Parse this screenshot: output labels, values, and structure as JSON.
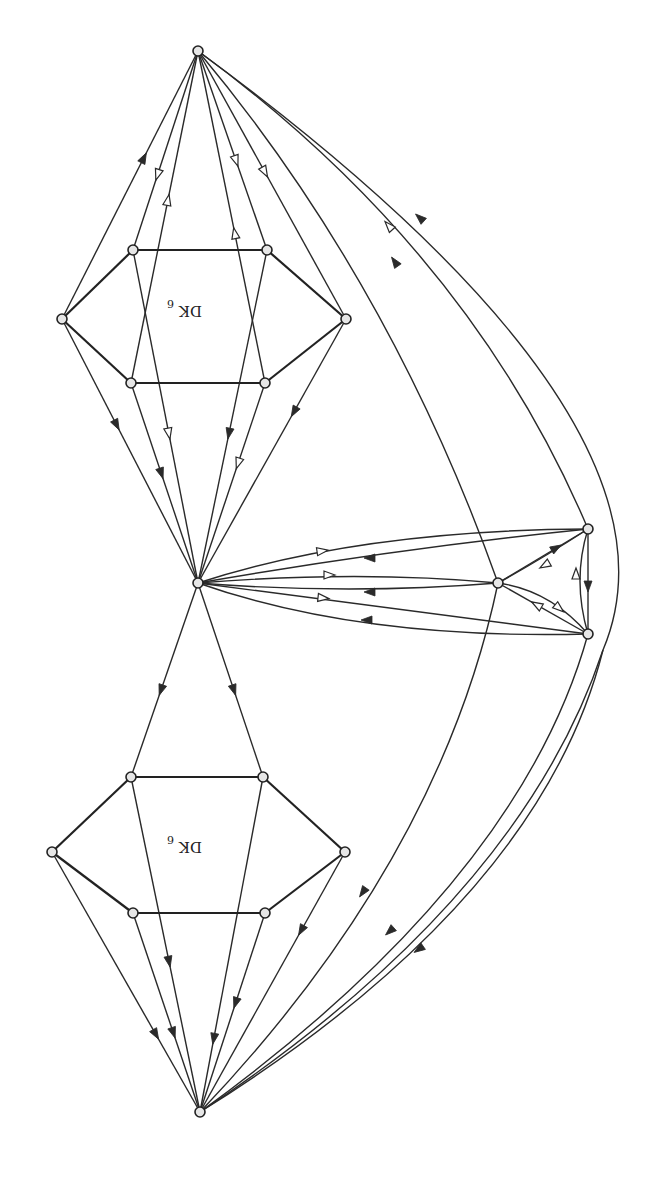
{
  "figure": {
    "orientation": "rotated 180 degrees",
    "labels": [
      {
        "id": "upper",
        "main": "DK",
        "sub": "6",
        "x": 186,
        "y": 312
      },
      {
        "id": "lower",
        "main": "DK",
        "sub": "6",
        "x": 186,
        "y": 848
      }
    ]
  },
  "vertices": {
    "T": [
      198,
      51
    ],
    "U_UL": [
      133,
      250
    ],
    "U_UR": [
      267,
      250
    ],
    "U_L": [
      62,
      319
    ],
    "U_R": [
      346,
      319
    ],
    "U_LL": [
      131,
      383
    ],
    "U_LR": [
      265,
      383
    ],
    "C": [
      198,
      583
    ],
    "L_UL": [
      131,
      777
    ],
    "L_UR": [
      263,
      777
    ],
    "L_L": [
      52,
      852
    ],
    "L_R": [
      345,
      852
    ],
    "L_LL": [
      133,
      913
    ],
    "L_LR": [
      265,
      913
    ],
    "B": [
      200,
      1112
    ],
    "S": [
      498,
      583
    ],
    "P": [
      588,
      529
    ],
    "Q": [
      588,
      634
    ]
  },
  "hexagon_edges": [
    [
      "U_UL",
      "U_UR"
    ],
    [
      "U_UR",
      "U_R"
    ],
    [
      "U_R",
      "U_LR"
    ],
    [
      "U_LR",
      "U_LL"
    ],
    [
      "U_LL",
      "U_L"
    ],
    [
      "U_L",
      "U_UL"
    ],
    [
      "L_UL",
      "L_UR"
    ],
    [
      "L_UR",
      "L_R"
    ],
    [
      "L_R",
      "L_LR"
    ],
    [
      "L_LR",
      "L_LL"
    ],
    [
      "L_LL",
      "L_L"
    ],
    [
      "L_L",
      "L_UL"
    ]
  ],
  "edges": [
    {
      "from": "U_L",
      "to": "T",
      "arrow": "solid",
      "t": 0.6
    },
    {
      "from": "U_LL",
      "to": "T",
      "arrow": "open",
      "t": 0.55
    },
    {
      "from": "U_LR",
      "to": "T",
      "arrow": "open",
      "t": 0.45
    },
    {
      "from": "T",
      "to": "U_UR",
      "arrow": "open",
      "t": 0.55
    },
    {
      "from": "T",
      "to": "U_R",
      "arrow": "open",
      "t": 0.45
    },
    {
      "from": "T",
      "to": "U_UL",
      "arrow": "open",
      "t": 0.62
    },
    {
      "from": "U_L",
      "to": "C",
      "arrow": "solid",
      "t": 0.4
    },
    {
      "from": "U_UL",
      "to": "C",
      "arrow": "open",
      "t": 0.55
    },
    {
      "from": "U_UR",
      "to": "C",
      "arrow": "solid",
      "t": 0.55
    },
    {
      "from": "U_LL",
      "to": "C",
      "arrow": "solid",
      "t": 0.45
    },
    {
      "from": "U_LR",
      "to": "C",
      "arrow": "open",
      "t": 0.4
    },
    {
      "from": "U_R",
      "to": "C",
      "arrow": "solid",
      "t": 0.35
    },
    {
      "from": "C",
      "to": "L_UL",
      "arrow": "solid",
      "t": 0.55
    },
    {
      "from": "C",
      "to": "L_UR",
      "arrow": "solid",
      "t": 0.55
    },
    {
      "from": "L_L",
      "to": "B",
      "arrow": "solid",
      "t": 0.7,
      "reverse": true
    },
    {
      "from": "L_LL",
      "to": "B",
      "arrow": "solid",
      "t": 0.6,
      "reverse": true
    },
    {
      "from": "L_UR",
      "to": "B",
      "arrow": "solid",
      "t": 0.78,
      "reverse": true
    },
    {
      "from": "L_UL",
      "to": "B",
      "arrow": "solid",
      "t": 0.55
    },
    {
      "from": "L_LR",
      "to": "B",
      "arrow": "solid",
      "t": 0.45
    },
    {
      "from": "L_R",
      "to": "B",
      "arrow": "solid",
      "t": 0.3
    }
  ],
  "curved_edges": [
    {
      "d": "M 198 51 Q 390 280 498 583",
      "arrow": "solid",
      "at": [
        395,
        262
      ],
      "angle": -125
    },
    {
      "d": "M 198 51 Q 470 250 588 529",
      "arrow": "open",
      "at": [
        389,
        226
      ],
      "angle": -132
    },
    {
      "d": "M 198 51 Q 700 420 603 650 Q 520 900 200 1112",
      "arrow": "solid",
      "at": [
        420,
        218
      ],
      "angle": -138
    },
    {
      "d": "M 498 583 Q 440 860 200 1112",
      "arrow": "solid",
      "at": [
        363,
        892
      ],
      "angle": 125
    },
    {
      "d": "M 588 634 Q 520 880 200 1112",
      "arrow": "solid",
      "at": [
        390,
        931
      ],
      "angle": 138
    },
    {
      "d": "M 603 650 Q 540 900 200 1112",
      "arrow": "solid",
      "at": [
        419,
        949
      ],
      "angle": 145
    },
    {
      "d": "M 198 583 Q 360 530 588 529",
      "arrow": "open",
      "at": [
        322,
        551
      ],
      "angle": -8
    },
    {
      "d": "M 198 583 Q 400 548 588 529",
      "arrow": "solid",
      "at": [
        370,
        558
      ],
      "angle": 180
    },
    {
      "d": "M 198 583 Q 360 570 498 583",
      "arrow": "open",
      "at": [
        329,
        575
      ],
      "angle": 0
    },
    {
      "d": "M 198 583 Q 350 595 498 583",
      "arrow": "solid",
      "at": [
        370,
        592
      ],
      "angle": 180
    },
    {
      "d": "M 198 583 Q 400 610 588 634",
      "arrow": "open",
      "at": [
        323,
        598
      ],
      "angle": 6
    },
    {
      "d": "M 198 583 Q 360 640 588 634",
      "arrow": "solid",
      "at": [
        367,
        620
      ],
      "angle": 180
    },
    {
      "d": "M 498 583 L 588 529",
      "arrow": "solid",
      "at": [
        556,
        548
      ],
      "angle": -30
    },
    {
      "d": "M 588 529 Q 540 560 498 583",
      "arrow": "open",
      "at": [
        545,
        565
      ],
      "angle": 150
    },
    {
      "d": "M 498 583 Q 550 590 588 634",
      "arrow": "open",
      "at": [
        559,
        608
      ],
      "angle": 40
    },
    {
      "d": "M 588 634 L 498 583",
      "arrow": "open",
      "at": [
        537,
        605
      ],
      "angle": 210
    },
    {
      "d": "M 588 529 L 588 634",
      "arrow": "solid",
      "at": [
        588,
        586
      ],
      "angle": 90
    },
    {
      "d": "M 588 634 Q 572 580 588 529",
      "arrow": "open",
      "at": [
        576,
        574
      ],
      "angle": -90
    }
  ]
}
